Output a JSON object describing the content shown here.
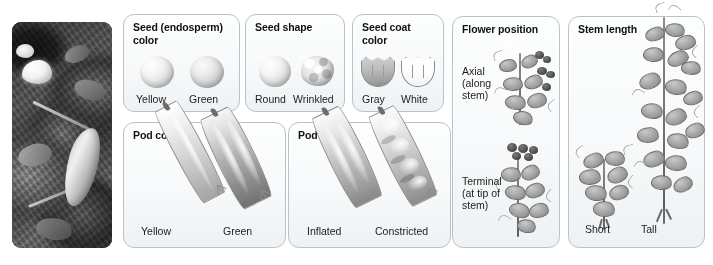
{
  "figure": {
    "photo": {
      "name": "pea-plant-photograph",
      "description": "Black-and-white photograph of a garden pea plant with a white flower and developing pods"
    }
  },
  "panels": [
    {
      "id": "seed-color",
      "title": "Seed (endosperm) color",
      "title_lines": [
        "Seed (endosperm)",
        "color"
      ],
      "variants": [
        {
          "label": "Yellow",
          "icon": "round-seed-icon"
        },
        {
          "label": "Green",
          "icon": "round-seed-icon"
        }
      ]
    },
    {
      "id": "seed-shape",
      "title": "Seed shape",
      "title_lines": [
        "Seed shape"
      ],
      "variants": [
        {
          "label": "Round",
          "icon": "round-seed-icon"
        },
        {
          "label": "Wrinkled",
          "icon": "wrinkled-seed-icon"
        }
      ]
    },
    {
      "id": "seed-coat-color",
      "title": "Seed coat color",
      "title_lines": [
        "Seed coat",
        "color"
      ],
      "variants": [
        {
          "label": "Gray",
          "icon": "gray-seed-coat-icon"
        },
        {
          "label": "White",
          "icon": "white-seed-coat-icon"
        }
      ]
    },
    {
      "id": "flower-position",
      "title": "Flower position",
      "title_lines": [
        "Flower position"
      ],
      "variants": [
        {
          "label": "Axial (along stem)",
          "label_lines": [
            "Axial",
            "(along",
            "stem)"
          ],
          "icon": "axial-flower-plant-icon"
        },
        {
          "label": "Terminal (at tip of stem)",
          "label_lines": [
            "Terminal",
            "(at tip of",
            "stem)"
          ],
          "icon": "terminal-flower-plant-icon"
        }
      ]
    },
    {
      "id": "stem-length",
      "title": "Stem length",
      "title_lines": [
        "Stem length"
      ],
      "variants": [
        {
          "label": "Short",
          "icon": "short-pea-plant-icon"
        },
        {
          "label": "Tall",
          "icon": "tall-pea-plant-icon"
        }
      ]
    },
    {
      "id": "pod-color",
      "title": "Pod color",
      "title_lines": [
        "Pod color"
      ],
      "variants": [
        {
          "label": "Yellow",
          "icon": "yellow-pea-pod-icon"
        },
        {
          "label": "Green",
          "icon": "green-pea-pod-icon"
        }
      ]
    },
    {
      "id": "pod-shape",
      "title": "Pod shape",
      "title_lines": [
        "Pod shape"
      ],
      "variants": [
        {
          "label": "Inflated",
          "icon": "inflated-pea-pod-icon"
        },
        {
          "label": "Constricted",
          "icon": "constricted-pea-pod-icon"
        }
      ]
    }
  ],
  "colors": {
    "panel_border": "#b8c4cc",
    "panel_background": "#f7f9fa",
    "page_background": "#ffffff",
    "text": "#1c1c1c",
    "title_text": "#111111"
  }
}
